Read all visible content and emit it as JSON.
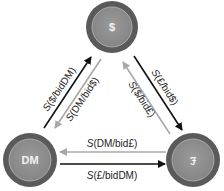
{
  "diagram": {
    "type": "currency-exchange-cycle",
    "nodes": [
      {
        "id": "usd",
        "label": "$",
        "cx": 112,
        "cy": 27,
        "r": 26
      },
      {
        "id": "dm",
        "label": "DM",
        "cx": 30,
        "cy": 160,
        "r": 27
      },
      {
        "id": "gbp",
        "label": "£",
        "cx": 193,
        "cy": 160,
        "r": 27
      }
    ],
    "edges": [
      {
        "id": "dm-to-usd",
        "from": "DM",
        "to": "$",
        "style": "dark",
        "label": "S($/bidDM)"
      },
      {
        "id": "usd-to-dm",
        "from": "$",
        "to": "DM",
        "style": "light",
        "label": "S(DM/bid$)"
      },
      {
        "id": "usd-to-gbp",
        "from": "$",
        "to": "£",
        "style": "dark",
        "label": "S(£/bid$)"
      },
      {
        "id": "gbp-to-usd",
        "from": "£",
        "to": "$",
        "style": "light",
        "label": "S($/bid£)"
      },
      {
        "id": "gbp-to-dm",
        "from": "£",
        "to": "DM",
        "style": "light",
        "label": "S(DM/bid£)"
      },
      {
        "id": "dm-to-gbp",
        "from": "DM",
        "to": "£",
        "style": "dark",
        "label": "S(£/bidDM)"
      }
    ],
    "colors": {
      "node_outer": "#5a5a5a",
      "node_inner": "#8e8e8e",
      "node_ring": "#b5b5b5",
      "arrow_dark": "#111111",
      "arrow_light": "#a8a8a8",
      "text": "#222222"
    }
  }
}
